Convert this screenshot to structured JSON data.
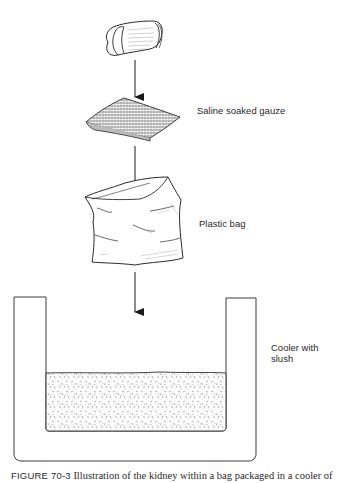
{
  "diagram": {
    "steps": [
      {
        "id": "kidney",
        "label": ""
      },
      {
        "id": "gauze",
        "label": "Saline soaked gauze"
      },
      {
        "id": "bag",
        "label": "Plastic bag"
      },
      {
        "id": "cooler",
        "label_line1": "Cooler with",
        "label_line2": "slush"
      }
    ],
    "arrows": [
      {
        "from": "kidney",
        "to": "gauze"
      },
      {
        "from": "gauze",
        "to": "bag"
      },
      {
        "from": "bag",
        "to": "cooler"
      }
    ],
    "colors": {
      "ink": "#2a2a2a",
      "background": "#ffffff",
      "slush_stipple": "#777777"
    }
  },
  "caption": {
    "figure_number": "FIGURE 70-3",
    "text": "Illustration of the kidney within a bag packaged in a cooler of"
  }
}
